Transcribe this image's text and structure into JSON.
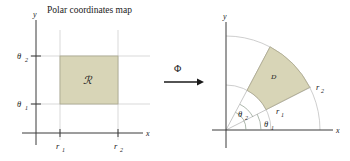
{
  "figure": {
    "title": "Polar coordinates map",
    "background_color": "#ffffff",
    "region_fill_color": "#d8d5b7",
    "axis_color": "#3a3a3a",
    "grid_color": "#cfcfcf"
  },
  "map_arrow": {
    "label": "Φ",
    "direction": "right"
  },
  "left_panel": {
    "name": "r-theta-plane",
    "axis_x_label": "x",
    "axis_y_label": "y",
    "region_label": "ℛ",
    "x_ticks": [
      {
        "label": "r",
        "subscript": "1"
      },
      {
        "label": "r",
        "subscript": "2"
      }
    ],
    "y_ticks": [
      {
        "label": "θ",
        "subscript": "1"
      },
      {
        "label": "θ",
        "subscript": "2"
      }
    ]
  },
  "right_panel": {
    "name": "xy-plane",
    "axis_x_label": "x",
    "axis_y_label": "y",
    "region_label": "ᴰ",
    "radius_labels": [
      {
        "label": "r",
        "subscript": "1"
      },
      {
        "label": "r",
        "subscript": "2"
      }
    ],
    "angle_labels": [
      {
        "label": "θ",
        "subscript": "1"
      },
      {
        "label": "θ",
        "subscript": "2"
      }
    ]
  }
}
